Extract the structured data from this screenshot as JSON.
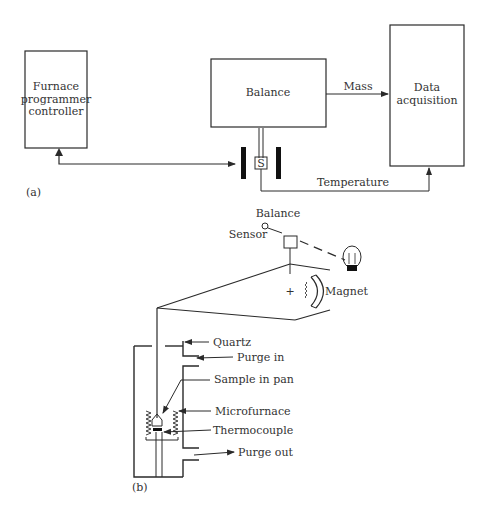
{
  "panel_a": {
    "label": "(a)",
    "furnace_box": {
      "line1": "Furnace",
      "line2": "programmer",
      "line3": "controller"
    },
    "balance_box": {
      "label": "Balance"
    },
    "data_box": {
      "line1": "Data",
      "line2": "acquisition"
    },
    "sample_label": "S",
    "mass_label": "Mass",
    "temperature_label": "Temperature"
  },
  "panel_b": {
    "label": "(b)",
    "balance_label": "Balance",
    "sensor_label": "Sensor",
    "magnet_label": "Magnet",
    "plus_sign": "+",
    "callouts": {
      "quartz": "Quartz",
      "purge_in": "Purge in",
      "sample_in_pan": "Sample in pan",
      "microfurnace": "Microfurnace",
      "thermocouple": "Thermocouple",
      "purge_out": "Purge out"
    }
  },
  "colors": {
    "line": "#2a2a2a",
    "text": "#333333",
    "background": "#ffffff"
  }
}
